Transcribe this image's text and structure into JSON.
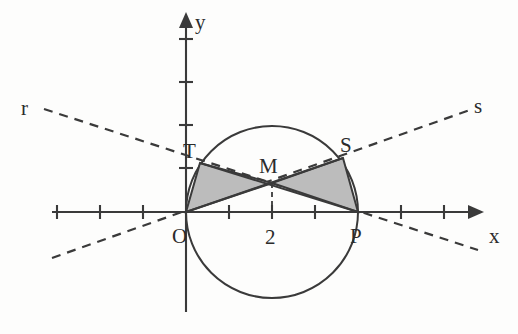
{
  "figure": {
    "background_color": "#fdfdfc",
    "ink_color": "#3a3a3a",
    "shade_color": "#bcbcbc"
  },
  "axes": {
    "x_label": "x",
    "y_label": "y",
    "x_tick_label": "2",
    "unit_px": 43,
    "origin_px": {
      "x": 186,
      "y": 212
    },
    "x_ticks_units": [
      -3,
      -2,
      -1,
      1,
      2,
      3,
      4,
      5
    ],
    "y_ticks_units": [
      1,
      2,
      3,
      4,
      5
    ]
  },
  "points": [
    {
      "name": "O",
      "label": "O",
      "x_units": 0,
      "y_units": 0,
      "px": {
        "x": 186,
        "y": 212
      },
      "label_px": {
        "x": 178,
        "y": 238
      }
    },
    {
      "name": "P",
      "label": "P",
      "x_units": 4,
      "y_units": 0,
      "px": {
        "x": 358,
        "y": 212
      },
      "label_px": {
        "x": 352,
        "y": 238
      }
    },
    {
      "name": "T",
      "label": "T",
      "x_units": 0.33,
      "y_units": 1.14,
      "px": {
        "x": 200,
        "y": 163
      },
      "label_px": {
        "x": 190,
        "y": 154
      }
    },
    {
      "name": "S",
      "label": "S",
      "x_units": 3.65,
      "y_units": 1.26,
      "px": {
        "x": 343,
        "y": 158
      },
      "label_px": {
        "x": 345,
        "y": 150
      }
    },
    {
      "name": "M",
      "label": "M",
      "x_units": 2,
      "y_units": 0.67,
      "px": {
        "x": 272,
        "y": 183
      },
      "label_px": {
        "x": 265,
        "y": 170
      }
    }
  ],
  "circle": {
    "center_units": {
      "x": 2,
      "y": 0
    },
    "radius_units": 2,
    "center_px": {
      "x": 272,
      "y": 212
    },
    "radius_px": 86
  },
  "lines": [
    {
      "name": "r",
      "label": "r",
      "style": "dashed",
      "label_px": {
        "x": 28,
        "y": 112
      },
      "from_px": {
        "x": 44,
        "y": 109
      },
      "to_px": {
        "x": 478,
        "y": 250
      }
    },
    {
      "name": "s",
      "label": "s",
      "style": "dashed",
      "label_px": {
        "x": 478,
        "y": 111
      },
      "from_px": {
        "x": 52,
        "y": 258
      },
      "to_px": {
        "x": 470,
        "y": 110
      }
    }
  ],
  "chords": [
    {
      "name": "TP",
      "from": "T",
      "to": "P"
    },
    {
      "name": "OS",
      "from": "O",
      "to": "S"
    }
  ],
  "shaded_regions": [
    {
      "name": "triangle-OTM",
      "vertices": [
        "O",
        "T",
        "M"
      ],
      "points_px": "186,212 200,163 272,183"
    },
    {
      "name": "triangle-MSP",
      "vertices": [
        "M",
        "S",
        "P"
      ],
      "points_px": "272,183 343,158 358,212"
    }
  ],
  "drop_line": {
    "name": "M-to-x-axis",
    "from_px": {
      "x": 272,
      "y": 183
    },
    "to_px": {
      "x": 272,
      "y": 212
    }
  }
}
